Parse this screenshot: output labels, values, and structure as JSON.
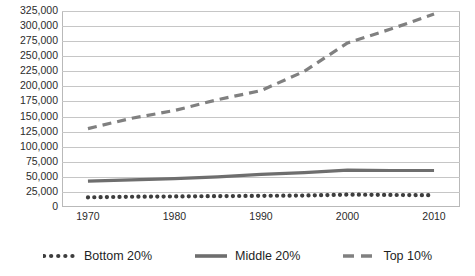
{
  "chart_data": {
    "type": "line",
    "title": "",
    "xlabel": "",
    "ylabel": "",
    "x": [
      1970,
      1980,
      1990,
      2000,
      2010
    ],
    "xlim": [
      1967,
      2013
    ],
    "ylim": [
      0,
      325000
    ],
    "ytick_step": 25000,
    "grid": true,
    "legend_position": "bottom",
    "xticks": [
      "1970",
      "1980",
      "1990",
      "2000",
      "2010"
    ],
    "yticks": [
      "325,000",
      "300,000",
      "275,000",
      "250,000",
      "225,000",
      "200,000",
      "175,000",
      "150,000",
      "125,000",
      "100,000",
      "75,000",
      "50,000",
      "25,000",
      "0"
    ],
    "series": [
      {
        "name": "Bottom 20%",
        "style": "dotted",
        "color": "#3d3d3d",
        "x": [
          1970,
          1975,
          1980,
          1985,
          1990,
          1995,
          2000,
          2005,
          2010
        ],
        "values": [
          16000,
          17000,
          17500,
          18000,
          18500,
          19000,
          20500,
          20000,
          19500
        ]
      },
      {
        "name": "Middle 20%",
        "style": "solid",
        "color": "#6e6e6e",
        "x": [
          1970,
          1975,
          1980,
          1985,
          1990,
          1995,
          2000,
          2005,
          2010
        ],
        "values": [
          43000,
          45000,
          47000,
          50000,
          54000,
          57000,
          61000,
          60500,
          60500
        ]
      },
      {
        "name": "Top 10%",
        "style": "dashed",
        "color": "#808080",
        "x": [
          1970,
          1975,
          1980,
          1985,
          1990,
          1995,
          2000,
          2005,
          2010
        ],
        "values": [
          130000,
          147000,
          160000,
          178000,
          193000,
          225000,
          272000,
          295000,
          320000
        ]
      }
    ]
  },
  "legend": {
    "items": [
      {
        "label": "Bottom 20%",
        "style": "dotted",
        "color": "#3d3d3d"
      },
      {
        "label": "Middle 20%",
        "style": "solid",
        "color": "#6e6e6e"
      },
      {
        "label": "Top 10%",
        "style": "dashed",
        "color": "#808080"
      }
    ]
  }
}
